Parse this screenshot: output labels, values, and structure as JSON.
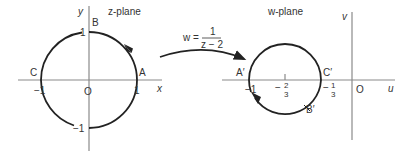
{
  "z_plane": {
    "title": "z-plane",
    "x_axis_label": "x",
    "y_axis_label": "y",
    "origin_label": "O",
    "points": {
      "A": {
        "label": "A",
        "value": "1"
      },
      "B": {
        "label": "B",
        "value": "1"
      },
      "C": {
        "label": "C",
        "value": "−1"
      },
      "D": {
        "label": "",
        "value": "−1"
      }
    },
    "tick_labels": {
      "x_pos": "1",
      "x_neg": "−1",
      "y_pos": "1",
      "y_neg": "−1"
    },
    "curve": "unit circle |z| = 1, counter-clockwise"
  },
  "mapping": {
    "lhs": "w =",
    "numerator": "1",
    "denominator": "z − 2"
  },
  "w_plane": {
    "title": "w-plane",
    "u_axis_label": "u",
    "v_axis_label": "v",
    "origin_label": "O",
    "points": {
      "A_prime": {
        "label": "A′",
        "value": "−1"
      },
      "B_prime": {
        "label": "B′"
      },
      "C_prime": {
        "label": "C′",
        "value": "−1/3"
      }
    },
    "tick_labels": {
      "minus_one": "−1",
      "minus_two_thirds_sign": "−",
      "minus_two_thirds_num": "2",
      "minus_two_thirds_den": "3",
      "minus_one_third_sign": "−",
      "minus_one_third_num": "1",
      "minus_one_third_den": "3"
    },
    "curve": "circle centre −2/3, radius 1/3, clockwise"
  },
  "colors": {
    "axis": "#8a8a8a",
    "curve": "#222222",
    "text": "#333333"
  }
}
